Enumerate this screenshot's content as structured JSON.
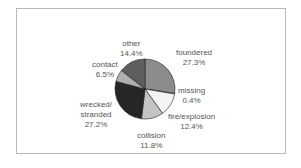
{
  "chart_data": {
    "type": "pie",
    "title": "",
    "start_angle_deg": 0,
    "direction": "clockwise",
    "slices": [
      {
        "label": "foundered",
        "value": 27.3,
        "pct_label": "27.3%",
        "color": "#8c8c8c"
      },
      {
        "label": "missing",
        "value": 0.4,
        "pct_label": "0.4%",
        "color": "#d8d8d8"
      },
      {
        "label": "fire/explosion",
        "value": 12.4,
        "pct_label": "12.4%",
        "color": "#f4f4f4"
      },
      {
        "label": "collision",
        "value": 11.8,
        "pct_label": "11.8%",
        "color": "#c4c4c4"
      },
      {
        "label": "wrecked/ stranded",
        "value": 27.2,
        "pct_label": "27.2%",
        "color": "#262626"
      },
      {
        "label": "contact",
        "value": 6.5,
        "pct_label": "6.5%",
        "color": "#b0b0b0"
      },
      {
        "label": "other",
        "value": 14.4,
        "pct_label": "14.4%",
        "color": "#5e5e5e"
      }
    ],
    "legend": "none (direct labels)"
  },
  "labels": {
    "foundered": {
      "name": "foundered",
      "pct": "27.3%"
    },
    "missing": {
      "name": "missing",
      "pct": "0.4%"
    },
    "fire": {
      "name": "fire/explosion",
      "pct": "12.4%"
    },
    "collision": {
      "name": "collision",
      "pct": "11.8%"
    },
    "wrecked": {
      "name1": "wrecked/",
      "name2": "stranded",
      "pct": "27.2%"
    },
    "contact": {
      "name": "contact",
      "pct": "6.5%"
    },
    "other": {
      "name": "other",
      "pct": "14.4%"
    }
  }
}
